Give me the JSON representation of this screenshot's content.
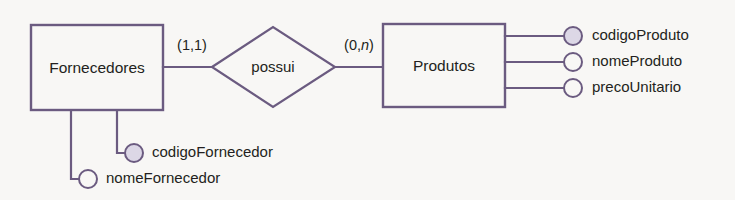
{
  "diagram": {
    "kind": "entity-relationship-diagram",
    "notation": "chen-min-max",
    "background_color": "#f8f7f5",
    "line_color": "#6b5b80",
    "text_color": "#231f20",
    "key_attribute_fill": "#dcd7e6",
    "plain_attribute_fill": "#f8f7f5"
  },
  "entities": [
    {
      "id": "fornecedores",
      "label": "Fornecedores",
      "attributes": [
        {
          "id": "codigo-fornecedor",
          "label": "codigoFornecedor",
          "is_key": true
        },
        {
          "id": "nome-fornecedor",
          "label": "nomeFornecedor",
          "is_key": false
        }
      ]
    },
    {
      "id": "produtos",
      "label": "Produtos",
      "attributes": [
        {
          "id": "codigo-produto",
          "label": "codigoProduto",
          "is_key": true
        },
        {
          "id": "nome-produto",
          "label": "nomeProduto",
          "is_key": false
        },
        {
          "id": "preco-unitario",
          "label": "precoUnitario",
          "is_key": false
        }
      ]
    }
  ],
  "relationship": {
    "id": "possui",
    "label": "possui",
    "left_cardinality": {
      "open": "(1,",
      "min": "1",
      "sep": ",",
      "max": "1",
      "close": ")",
      "text": "(1,1)"
    },
    "right_cardinality": {
      "open": "(0,",
      "min": "0",
      "sep": ",",
      "max": "n",
      "close": ")",
      "text": "(0,n)"
    }
  },
  "cardinalities": {
    "left_prefix": "(1,",
    "left_max": "1",
    "left_suffix": ")",
    "right_prefix": "(0,",
    "right_max": "n",
    "right_suffix": ")"
  }
}
